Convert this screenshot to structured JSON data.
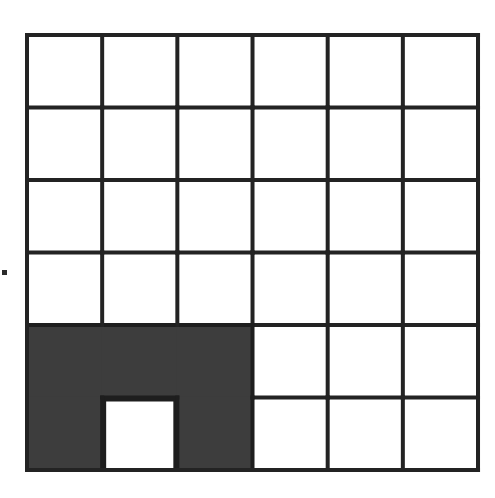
{
  "figure": {
    "grid": {
      "columns": 6,
      "rows": 6,
      "origin_x": 27,
      "origin_y": 35,
      "cell_width": 75.17,
      "cell_height": 72.5,
      "line_color": "#232323",
      "line_width": 4,
      "background_color": "#ffffff"
    },
    "shaded_region": {
      "fill_color": "#3d3d3d",
      "outline_color": "#1e1e1e",
      "covered_cells": [
        {
          "row": 5,
          "col": 1
        },
        {
          "row": 5,
          "col": 2
        },
        {
          "row": 5,
          "col": 3
        },
        {
          "row": 6,
          "col": 1
        },
        {
          "row": 6,
          "col": 3
        }
      ],
      "excluded_cells": [
        {
          "row": 6,
          "col": 2
        }
      ],
      "shaded_cell_count": 5,
      "total_cell_count": 36
    },
    "hole": {
      "row": 6,
      "col": 2,
      "fill_color": "#ffffff",
      "label": "white-square-hole"
    },
    "artifact": {
      "label": "scan-speck",
      "color": "#2b2b2b"
    }
  },
  "chart_data": {
    "type": "heatmap",
    "xlabel": "",
    "ylabel": "",
    "categories": [
      "c1",
      "c2",
      "c3",
      "c4",
      "c5",
      "c6"
    ],
    "rows": [
      "r1",
      "r2",
      "r3",
      "r4",
      "r5",
      "r6"
    ],
    "legend": [
      {
        "name": "shaded",
        "color": "#3d3d3d",
        "value": 1
      },
      {
        "name": "unshaded",
        "color": "#ffffff",
        "value": 0
      }
    ],
    "grid": true,
    "values": [
      [
        0,
        0,
        0,
        0,
        0,
        0
      ],
      [
        0,
        0,
        0,
        0,
        0,
        0
      ],
      [
        0,
        0,
        0,
        0,
        0,
        0
      ],
      [
        0,
        0,
        0,
        0,
        0,
        0
      ],
      [
        1,
        1,
        1,
        0,
        0,
        0
      ],
      [
        1,
        0,
        1,
        0,
        0,
        0
      ]
    ],
    "shaded_count": 5,
    "total_count": 36,
    "fraction_shaded": "5/36"
  }
}
